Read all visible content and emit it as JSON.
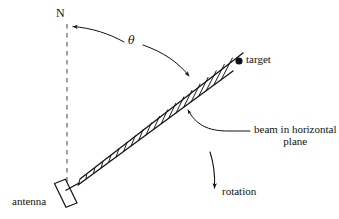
{
  "figure": {
    "type": "technical-diagram",
    "background_color": "#ffffff",
    "stroke_color": "#111111"
  },
  "labels": {
    "north": "N",
    "theta": "θ",
    "target": "target",
    "beam_line1": "beam in horizontal",
    "beam_line2": "plane",
    "rotation": "rotation",
    "antenna": "antenna"
  },
  "elements": {
    "north_reference": {
      "name": "dashed vertical north line",
      "style": "dashed",
      "x": 67,
      "y_top": 24,
      "y_bottom": 186
    },
    "theta_arc": {
      "name": "angle arc from north to beam",
      "arrow_start": "north",
      "arrow_end": "beam",
      "double_headed": true
    },
    "beam": {
      "name": "hatched horizontal beam strip",
      "hatch": "ladder rungs",
      "origin": "antenna",
      "direction": "upper right",
      "open_end": true
    },
    "target_dot": {
      "name": "target point marker",
      "cx": 239,
      "cy": 61,
      "r": 3.6,
      "filled": true
    },
    "rotation_arrow": {
      "name": "downward rotation arrow",
      "x": 213,
      "y_top": 152,
      "y_bottom": 192
    },
    "antenna_body": {
      "name": "tilted rectangular antenna face",
      "cx": 62,
      "cy": 196
    }
  }
}
